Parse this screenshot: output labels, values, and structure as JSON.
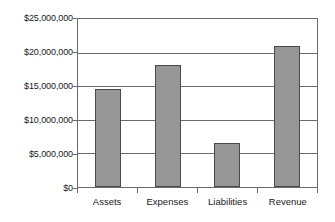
{
  "chart_data": {
    "type": "bar",
    "title": "",
    "xlabel": "",
    "ylabel": "",
    "categories": [
      "Assets",
      "Expenses",
      "Liabilities",
      "Revenue"
    ],
    "values": [
      14600000,
      18100000,
      6500000,
      21000000
    ],
    "ylim": [
      0,
      25000000
    ],
    "ytick_values": [
      0,
      5000000,
      10000000,
      15000000,
      20000000,
      25000000
    ],
    "ytick_labels": [
      "$0",
      "$5,000,000",
      "$10,000,000",
      "$15,000,000",
      "$20,000,000",
      "$25,000,000"
    ],
    "grid": "horizontal",
    "legend": "none",
    "bar_color": "#969696",
    "bar_edge_color": "#4a4a4a",
    "axis_color": "#6b6b6b",
    "background_color": "#ffffff"
  }
}
